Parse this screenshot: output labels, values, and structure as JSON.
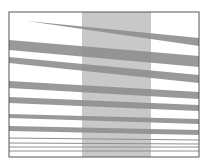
{
  "figure": {
    "width": 205,
    "height": 166,
    "frame": {
      "x": 9,
      "y": 12,
      "w": 190,
      "h": 145,
      "stroke": "#555555"
    },
    "stripe": {
      "x": 82,
      "w": 69,
      "fill": "#c8c8c8"
    },
    "band_color": "#8e8e8e",
    "bands": [
      {
        "name": "wedge-top",
        "points": "27,21 199,38 199,46"
      },
      {
        "name": "band-2",
        "points": "9,40 199,56 199,67 9,50"
      },
      {
        "name": "band-3",
        "points": "9,57 199,75 199,83 9,63"
      },
      {
        "name": "band-4",
        "points": "9,81 199,92 199,99 9,88"
      },
      {
        "name": "band-5",
        "points": "9,97 199,105 199,111 9,103"
      },
      {
        "name": "band-6",
        "points": "9,114 199,119 199,124 9,118"
      },
      {
        "name": "band-7",
        "points": "9,126 199,130 199,135 9,131"
      }
    ],
    "lines": [
      {
        "name": "line-1",
        "y1": 138,
        "y2": 140
      },
      {
        "name": "line-2",
        "y1": 143,
        "y2": 144
      },
      {
        "name": "line-3",
        "y1": 147,
        "y2": 147
      },
      {
        "name": "line-4",
        "y1": 151,
        "y2": 151
      }
    ]
  }
}
